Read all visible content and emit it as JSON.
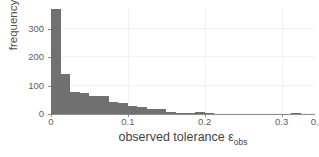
{
  "chart_data": {
    "type": "bar",
    "title": "",
    "subtitle": "",
    "xlabel": "observed tolerance",
    "xlabel_symbol": "ε",
    "xlabel_symbol_sub": "obs",
    "ylabel": "frequency",
    "xlim": [
      0.0,
      0.3435
    ],
    "ylim": [
      0,
      375
    ],
    "grid": true,
    "legend": null,
    "bin_width": 0.0125,
    "x_ticks": [
      0,
      0.1,
      0.2,
      0.3,
      0.35
    ],
    "x_tick_labels": [
      "0",
      "0.1",
      "0.2",
      "0.3",
      "0.35"
    ],
    "y_ticks": [
      0,
      100,
      200,
      300
    ],
    "y_tick_labels": [
      "0",
      "100",
      "200",
      "300"
    ],
    "bar_color": "#707070",
    "axis_color": "#8d8d8d",
    "grid_color": "#f2f2f3",
    "background_color": "#ffffff",
    "bin_left_edges": [
      0.0,
      0.0125,
      0.025,
      0.0375,
      0.05,
      0.0625,
      0.075,
      0.0875,
      0.1,
      0.1125,
      0.125,
      0.1375,
      0.15,
      0.1625,
      0.175,
      0.1875,
      0.2,
      0.2125,
      0.225,
      0.2375,
      0.25,
      0.2625,
      0.275,
      0.2875,
      0.3,
      0.3125,
      0.325
    ],
    "values": [
      370,
      140,
      78,
      76,
      62,
      62,
      42,
      40,
      28,
      26,
      18,
      17,
      8,
      4,
      4,
      6,
      5,
      0,
      0,
      0,
      0,
      0,
      0,
      0,
      0,
      4,
      0
    ],
    "categories": [
      "0.0000",
      "0.0125",
      "0.0250",
      "0.0375",
      "0.0500",
      "0.0625",
      "0.0750",
      "0.0875",
      "0.1000",
      "0.1125",
      "0.1250",
      "0.1375",
      "0.1500",
      "0.1625",
      "0.1750",
      "0.1875",
      "0.2000",
      "0.2125",
      "0.2250",
      "0.2375",
      "0.2500",
      "0.2625",
      "0.2750",
      "0.2875",
      "0.3000",
      "0.3125",
      "0.3250"
    ]
  }
}
